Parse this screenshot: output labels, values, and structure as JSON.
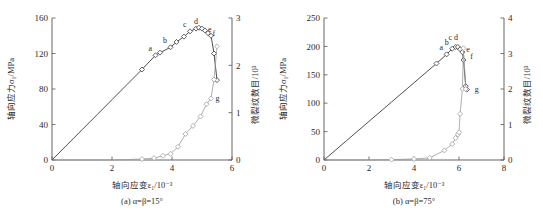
{
  "figure": {
    "panels": [
      {
        "id": "panel-a",
        "caption": "(a) α=β=15°",
        "x_axis": {
          "title": "轴向应变ε₁/10⁻³",
          "ticks": [
            "0",
            "2",
            "4",
            "6"
          ],
          "min": 0,
          "max": 6
        },
        "y_axis_left": {
          "title": "轴向应力σ₁/MPa",
          "ticks": [
            "0",
            "40",
            "80",
            "120",
            "160"
          ],
          "min": 0,
          "max": 160
        },
        "y_axis_right": {
          "title": "微裂纹数目/10³",
          "ticks": [
            "0",
            "1",
            "2",
            "3"
          ],
          "min": 0,
          "max": 3
        },
        "point_labels": [
          "a",
          "b",
          "c",
          "d",
          "e",
          "f",
          "g"
        ]
      },
      {
        "id": "panel-b",
        "caption": "(b) α=β=75°",
        "x_axis": {
          "title": "轴向应变ε₁/10⁻³",
          "ticks": [
            "0",
            "2",
            "4",
            "6",
            "8"
          ],
          "min": 0,
          "max": 8
        },
        "y_axis_left": {
          "title": "轴向应力σ₁/MPa",
          "ticks": [
            "0",
            "50",
            "100",
            "150",
            "200",
            "250"
          ],
          "min": 0,
          "max": 250
        },
        "y_axis_right": {
          "title": "微裂纹数目/10³",
          "ticks": [
            "0",
            "1",
            "2",
            "3",
            "4"
          ],
          "min": 0,
          "max": 4
        },
        "point_labels": [
          "a",
          "b",
          "c",
          "d",
          "e",
          "f",
          "g"
        ]
      }
    ]
  },
  "chart_data": [
    {
      "type": "line",
      "id": "panel-a",
      "title": "",
      "subtitle": "(a) α=β=15°",
      "xlabel": "轴向应变ε₁/10⁻³",
      "ylabel": "轴向应力σ₁/MPa",
      "y2label": "微裂纹数目/10³",
      "xlim": [
        0,
        6
      ],
      "ylim": [
        0,
        160
      ],
      "y2lim": [
        0,
        3
      ],
      "xticks": [
        0,
        2,
        4,
        6
      ],
      "yticks": [
        0,
        40,
        80,
        120,
        160
      ],
      "y2ticks": [
        0,
        1,
        2,
        3
      ],
      "grid": false,
      "legend": "none",
      "series": [
        {
          "name": "轴向应力-应变曲线",
          "axis": "left",
          "marker": "diamond-open",
          "color": "#3b3b3b",
          "x": [
            0.0,
            0.5,
            1.0,
            1.5,
            2.0,
            2.5,
            3.0,
            3.45,
            3.6,
            3.95,
            4.15,
            4.4,
            4.6,
            4.8,
            4.9,
            5.0,
            5.1,
            5.2,
            5.3,
            5.4,
            5.5
          ],
          "y": [
            0,
            17,
            34,
            51,
            68,
            85,
            102,
            118,
            121,
            127,
            133,
            139,
            145,
            148,
            149,
            148,
            146,
            143,
            140,
            120,
            90
          ]
        },
        {
          "name": "微裂纹数目曲线",
          "axis": "right",
          "marker": "diamond-open",
          "color": "#9a9a9a",
          "x": [
            0.0,
            1.0,
            2.0,
            3.0,
            3.4,
            3.7,
            3.95,
            4.2,
            4.45,
            4.7,
            4.95,
            5.15,
            5.3,
            5.4,
            5.5
          ],
          "y": [
            0.0,
            0.0,
            0.0,
            0.02,
            0.04,
            0.09,
            0.13,
            0.28,
            0.55,
            0.72,
            0.92,
            1.18,
            1.3,
            1.7,
            2.4
          ]
        }
      ],
      "annotations": [
        {
          "label": "a",
          "x": 3.45,
          "y": 118,
          "axis": "left"
        },
        {
          "label": "b",
          "x": 3.95,
          "y": 127,
          "axis": "left"
        },
        {
          "label": "c",
          "x": 4.6,
          "y": 145,
          "axis": "left"
        },
        {
          "label": "d",
          "x": 4.9,
          "y": 149,
          "axis": "left"
        },
        {
          "label": "e",
          "x": 5.05,
          "y": 147,
          "axis": "left"
        },
        {
          "label": "f",
          "x": 5.2,
          "y": 143,
          "axis": "left"
        },
        {
          "label": "g",
          "x": 5.3,
          "y": 1.3,
          "axis": "right"
        }
      ]
    },
    {
      "type": "line",
      "id": "panel-b",
      "title": "",
      "subtitle": "(b) α=β=75°",
      "xlabel": "轴向应变ε₁/10⁻³",
      "ylabel": "轴向应力σ₁/MPa",
      "y2label": "微裂纹数目/10³",
      "xlim": [
        0,
        8
      ],
      "ylim": [
        0,
        250
      ],
      "y2lim": [
        0,
        4
      ],
      "xticks": [
        0,
        2,
        4,
        6,
        8
      ],
      "yticks": [
        0,
        50,
        100,
        150,
        200,
        250
      ],
      "y2ticks": [
        0,
        1,
        2,
        3,
        4
      ],
      "grid": false,
      "legend": "none",
      "series": [
        {
          "name": "轴向应力-应变曲线",
          "axis": "left",
          "marker": "diamond-open",
          "color": "#3b3b3b",
          "x": [
            0.0,
            1.0,
            2.0,
            3.0,
            4.0,
            5.0,
            5.45,
            5.7,
            5.85,
            5.95,
            6.05,
            6.15,
            6.2,
            6.3,
            6.35
          ],
          "y": [
            0,
            34,
            68,
            102,
            136,
            170,
            186,
            196,
            199,
            199,
            195,
            190,
            176,
            130,
            124
          ]
        },
        {
          "name": "微裂纹数目曲线",
          "axis": "right",
          "marker": "diamond-open",
          "color": "#9a9a9a",
          "x": [
            0.0,
            1.0,
            2.0,
            3.0,
            4.0,
            4.7,
            5.35,
            5.7,
            5.85,
            5.95,
            6.0,
            6.05,
            6.15,
            6.2,
            6.3
          ],
          "y": [
            0.0,
            0.0,
            0.0,
            0.01,
            0.03,
            0.06,
            0.27,
            0.45,
            0.62,
            0.72,
            0.78,
            1.3,
            2.0,
            3.15,
            2.0
          ]
        }
      ],
      "annotations": [
        {
          "label": "a",
          "x": 5.45,
          "y": 186,
          "axis": "left"
        },
        {
          "label": "b",
          "x": 5.7,
          "y": 196,
          "axis": "left"
        },
        {
          "label": "c",
          "x": 5.85,
          "y": 205,
          "axis": "left"
        },
        {
          "label": "d",
          "x": 6.0,
          "y": 205,
          "axis": "left"
        },
        {
          "label": "e",
          "x": 6.12,
          "y": 195,
          "axis": "left"
        },
        {
          "label": "f",
          "x": 6.3,
          "y": 183,
          "axis": "left"
        },
        {
          "label": "g",
          "x": 6.5,
          "y": 2.0,
          "axis": "right"
        }
      ]
    }
  ]
}
